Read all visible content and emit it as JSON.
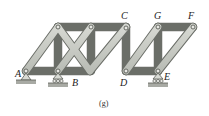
{
  "figure": {
    "caption": "(g)",
    "type": "truss",
    "colors": {
      "member_fill": "#c9ccc6",
      "member_stroke": "#6b6e68",
      "pin": "#e8e8e4",
      "ground": "#a8aaa4",
      "label": "#222222"
    }
  },
  "labels": {
    "A": "A",
    "B": "B",
    "C": "C",
    "D": "D",
    "E": "E",
    "F": "F",
    "G": "G"
  },
  "joints": [
    {
      "id": "A",
      "x": 26,
      "y": 71
    },
    {
      "id": "B",
      "x": 58,
      "y": 71
    },
    {
      "id": "M",
      "x": 90,
      "y": 71
    },
    {
      "id": "T1",
      "x": 58,
      "y": 27
    },
    {
      "id": "T2",
      "x": 91,
      "y": 27
    },
    {
      "id": "C",
      "x": 126,
      "y": 28
    },
    {
      "id": "D",
      "x": 126,
      "y": 71
    },
    {
      "id": "E",
      "x": 158,
      "y": 71
    },
    {
      "id": "G",
      "x": 158,
      "y": 27
    },
    {
      "id": "F",
      "x": 193,
      "y": 27
    }
  ],
  "supports": [
    {
      "at": "A",
      "type": "pin"
    },
    {
      "at": "B",
      "type": "roller"
    },
    {
      "at": "E",
      "type": "roller"
    }
  ]
}
